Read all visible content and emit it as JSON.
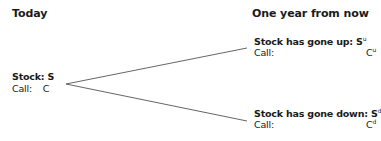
{
  "headings": {
    "today": "Today",
    "future": "One year from now"
  },
  "today_node": {
    "stock_label": "Stock: S",
    "call_label": "Call:",
    "call_value": "C"
  },
  "up_node": {
    "stock_label": "Stock has gone up: S",
    "stock_sup": "u",
    "call_label": "Call:",
    "call_value": "C",
    "call_sup": "u"
  },
  "down_node": {
    "stock_label": "Stock has gone down: S",
    "stock_sup": "d",
    "call_label": "Call:",
    "call_value": "C",
    "call_sup": "d"
  },
  "colors": {
    "line": "#555555",
    "text": "#1a1a1a"
  }
}
